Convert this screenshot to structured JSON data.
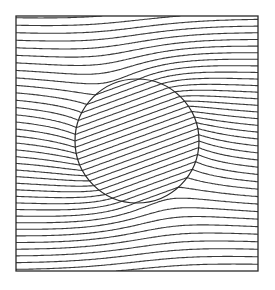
{
  "diagram": {
    "kind": "field-lines-around-circular-inclusion",
    "outer_line_count": 36,
    "interior_line_angle_deg": 20,
    "interior_density_ratio": 1.17,
    "line_color": "#3a3a3a",
    "frame_color": "#2a2a2a",
    "background_color": "#ffffff"
  }
}
